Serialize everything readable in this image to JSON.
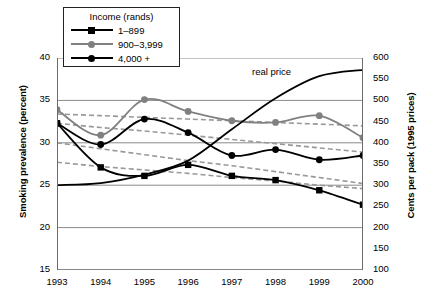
{
  "chart_data": {
    "type": "line",
    "title": "",
    "xlabel": "",
    "ylabel": "Smoking prevalence (percent)",
    "y2label": "Cents per pack (1995 prices)",
    "x": [
      1993,
      1994,
      1995,
      1996,
      1997,
      1998,
      1999,
      2000
    ],
    "xticklabels": [
      "1993",
      "1994",
      "1995",
      "1996",
      "1997",
      "1998",
      "1999",
      "2000"
    ],
    "ylim": [
      15,
      40
    ],
    "yticks": [
      15,
      20,
      25,
      30,
      35,
      40
    ],
    "yticklabels": [
      "15",
      "20",
      "25",
      "30",
      "35",
      "40"
    ],
    "y2lim": [
      100,
      600
    ],
    "y2ticks": [
      100,
      150,
      200,
      250,
      300,
      350,
      400,
      450,
      500,
      550,
      600
    ],
    "y2ticklabels": [
      "100",
      "150",
      "200",
      "250",
      "300",
      "350",
      "400",
      "450",
      "500",
      "550",
      "600"
    ],
    "grid": "horizontal-major",
    "legend": {
      "position": "top-left",
      "title": "Income (rands)",
      "entries": [
        {
          "label": "1–899",
          "color": "#000000",
          "marker": "square"
        },
        {
          "label": "900–3,999",
          "color": "#808080",
          "marker": "circle"
        },
        {
          "label": "4,000 +",
          "color": "#000000",
          "marker": "circle"
        }
      ]
    },
    "series": [
      {
        "name": "1–899",
        "axis": "left",
        "color": "#000000",
        "marker": "square",
        "style": "solid",
        "values": [
          32.3,
          27.1,
          26.1,
          27.4,
          26.1,
          25.6,
          24.4,
          22.7
        ]
      },
      {
        "name": "900–3,999",
        "axis": "left",
        "color": "#808080",
        "marker": "circle",
        "style": "solid",
        "values": [
          33.9,
          30.9,
          35.1,
          33.7,
          32.6,
          32.4,
          33.2,
          30.6
        ]
      },
      {
        "name": "4,000 +",
        "axis": "left",
        "color": "#000000",
        "marker": "circle",
        "style": "solid",
        "values": [
          32.3,
          29.8,
          32.8,
          31.2,
          28.5,
          29.2,
          28.0,
          28.5
        ]
      },
      {
        "name": "real price",
        "axis": "right",
        "color": "#000000",
        "marker": "none",
        "style": "solid",
        "annotation": "real price",
        "values": [
          300,
          305,
          325,
          358,
          432,
          505,
          557,
          572
        ]
      },
      {
        "name": "trend 1–899",
        "axis": "left",
        "color": "#999999",
        "marker": "none",
        "style": "dashed",
        "values": [
          27.7,
          27.2,
          26.8,
          26.4,
          25.9,
          25.5,
          25.0,
          24.6
        ]
      },
      {
        "name": "trend 900–3,999",
        "axis": "left",
        "color": "#999999",
        "marker": "none",
        "style": "dashed",
        "values": [
          33.4,
          33.2,
          33.0,
          32.8,
          32.6,
          32.4,
          32.2,
          32.0
        ]
      },
      {
        "name": "trend 4,000 +",
        "axis": "left",
        "color": "#999999",
        "marker": "none",
        "style": "dashed",
        "values": [
          32.3,
          31.8,
          31.4,
          30.9,
          30.4,
          29.9,
          29.4,
          28.9
        ]
      },
      {
        "name": "trend lower",
        "axis": "left",
        "color": "#999999",
        "marker": "none",
        "style": "dashed",
        "values": [
          30.0,
          29.3,
          28.6,
          27.9,
          27.3,
          26.6,
          25.9,
          25.2
        ]
      }
    ]
  }
}
